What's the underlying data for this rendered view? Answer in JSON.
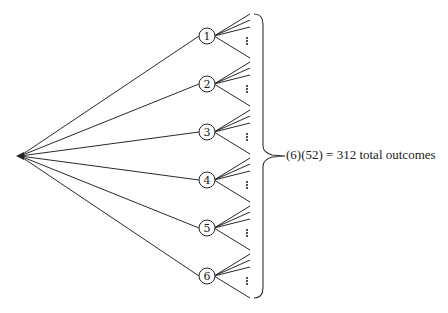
{
  "diagram": {
    "type": "tree-diagram",
    "root": {
      "x": 20,
      "y": 156
    },
    "first_stage_nodes": [
      {
        "label": "1",
        "x": 207,
        "y": 36
      },
      {
        "label": "2",
        "x": 207,
        "y": 84
      },
      {
        "label": "3",
        "x": 207,
        "y": 132
      },
      {
        "label": "4",
        "x": 207,
        "y": 180
      },
      {
        "label": "5",
        "x": 207,
        "y": 228
      },
      {
        "label": "6",
        "x": 207,
        "y": 276
      }
    ],
    "sub_branch_offsets": [
      -22,
      -16,
      -9,
      22
    ],
    "ellipsis": "⋮",
    "caption": "(6)(52) = 312 total outcomes",
    "first_stage_count": 6,
    "second_stage_count": 52,
    "total_outcomes": 312
  }
}
